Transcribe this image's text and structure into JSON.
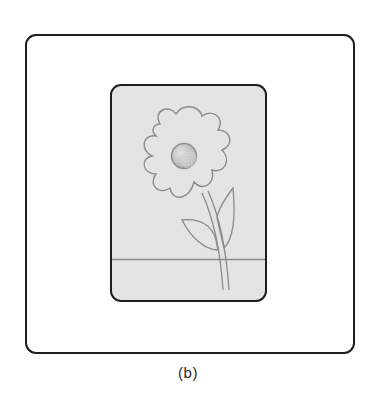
{
  "figure": {
    "caption": "(b)",
    "colors": {
      "frame_stroke": "#1e1e1e",
      "card_fill": "#e4e4e4",
      "card_stroke": "#1e1e1e",
      "drawing_stroke": "#8a8a8a",
      "flower_center_fill": "#d4d4d4"
    },
    "content": {
      "outer_frame": "rounded-square-frame",
      "inner_card": "rounded-rectangle-card",
      "illustration": "flower-with-stem-and-two-leaves",
      "ground_line": "horizontal-line"
    }
  }
}
